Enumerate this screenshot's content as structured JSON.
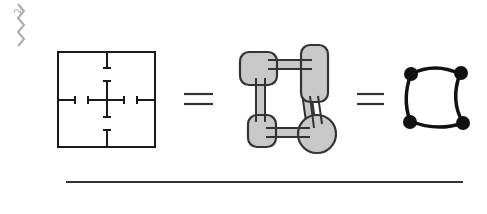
{
  "figure": {
    "corner_mark": {
      "icon": "zigzag-squiggle-icon",
      "superscript": "2",
      "color": "#aaaaaa"
    },
    "panels": [
      {
        "id": "grid-square",
        "description": "Square with cross of T-shaped tick segments"
      },
      {
        "id": "equals-1",
        "symbol": "="
      },
      {
        "id": "blob-chain",
        "description": "Four rounded grey blobs linked by bars in a cycle"
      },
      {
        "id": "equals-2",
        "symbol": "="
      },
      {
        "id": "node-cycle",
        "description": "Four black nodes connected in a curved cycle"
      }
    ],
    "colors": {
      "line": "#1a1a1a",
      "blob_fill": "#c8c8c8",
      "blob_stroke": "#333333",
      "node": "#111111"
    }
  }
}
